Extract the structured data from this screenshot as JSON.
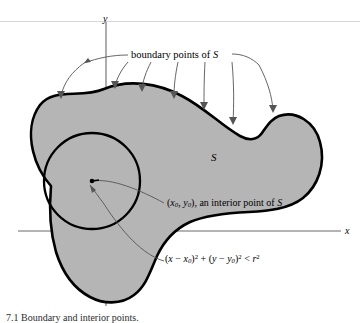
{
  "figure": {
    "type": "math-diagram",
    "background_color": "#ffffff",
    "region_fill_color": "#b5b5b5",
    "region_stroke_color": "#000000",
    "axis_color": "#6b6b6b",
    "leader_color": "#555555"
  },
  "axes": {
    "x_label": "x",
    "y_label": "y"
  },
  "labels": {
    "region": "S",
    "boundary_text_before": "boundary points of ",
    "boundary_text_italic": "S",
    "interior_point": {
      "open_paren": "(",
      "x0_var": "x",
      "x0_sub": "0",
      "comma": ", ",
      "y0_var": "y",
      "y0_sub": "0",
      "close": "), an interior point of ",
      "set": "S"
    },
    "inequality": {
      "part1_open": "(",
      "x_var": "x",
      "minus1": " − ",
      "x0_var": "x",
      "x0_sub": "0",
      "part1_close": ")",
      "sq1": "2",
      "plus": " + ",
      "part2_open": "(",
      "y_var": "y",
      "minus2": " − ",
      "y0_var": "y",
      "y0_sub": "0",
      "part2_close": ")",
      "sq2": "2",
      "rel": " < ",
      "r_var": "r",
      "sq3": "2"
    }
  },
  "caption": {
    "text": "7.1   Boundary and interior points."
  },
  "annotations": {
    "boundary_arrow_count": 6
  }
}
